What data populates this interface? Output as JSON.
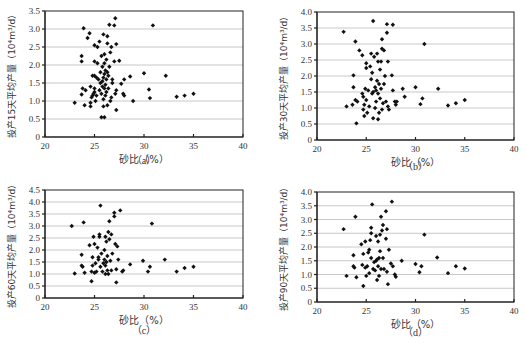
{
  "chart_data": [
    {
      "type": "scatter",
      "panel": "a",
      "caption": "（a）",
      "xlabel": "砂比（%）",
      "ylabel": "投产15天平均产量（10⁴m³/d）",
      "xlim": [
        20,
        40
      ],
      "ylim": [
        0,
        3.5
      ],
      "xticks": [
        "20",
        "25",
        "30",
        "35",
        "40"
      ],
      "yticks": [
        "0",
        "0.5",
        "1.0",
        "1.5",
        "2.0",
        "2.5",
        "3.0",
        "3.5"
      ],
      "ystep": 0.5,
      "grid": true,
      "points": [
        [
          23.0,
          0.95
        ],
        [
          23.7,
          1.18
        ],
        [
          23.8,
          1.35
        ],
        [
          23.7,
          2.1
        ],
        [
          23.7,
          2.25
        ],
        [
          23.9,
          3.02
        ],
        [
          24.0,
          0.88
        ],
        [
          24.1,
          1.3
        ],
        [
          24.3,
          2.75
        ],
        [
          24.5,
          2.88
        ],
        [
          24.6,
          0.85
        ],
        [
          24.6,
          0.95
        ],
        [
          24.6,
          1.4
        ],
        [
          24.7,
          1.1
        ],
        [
          24.8,
          1.15
        ],
        [
          24.8,
          1.7
        ],
        [
          24.9,
          1.2
        ],
        [
          25.0,
          1.25
        ],
        [
          25.0,
          1.35
        ],
        [
          25.0,
          1.7
        ],
        [
          25.0,
          2.1
        ],
        [
          25.0,
          2.55
        ],
        [
          25.1,
          1.0
        ],
        [
          25.2,
          1.15
        ],
        [
          25.2,
          1.65
        ],
        [
          25.3,
          2.05
        ],
        [
          25.3,
          2.5
        ],
        [
          25.4,
          1.6
        ],
        [
          25.5,
          1.3
        ],
        [
          25.5,
          2.65
        ],
        [
          25.6,
          1.5
        ],
        [
          25.6,
          1.8
        ],
        [
          25.7,
          0.55
        ],
        [
          25.7,
          1.2
        ],
        [
          25.7,
          2.25
        ],
        [
          25.8,
          1.4
        ],
        [
          25.8,
          1.55
        ],
        [
          25.8,
          1.95
        ],
        [
          25.9,
          0.85
        ],
        [
          25.9,
          1.05
        ],
        [
          25.9,
          1.65
        ],
        [
          25.9,
          2.85
        ],
        [
          26.0,
          0.55
        ],
        [
          26.0,
          1.35
        ],
        [
          26.0,
          1.75
        ],
        [
          26.0,
          2.05
        ],
        [
          26.0,
          2.3
        ],
        [
          26.1,
          1.15
        ],
        [
          26.1,
          1.45
        ],
        [
          26.1,
          1.85
        ],
        [
          26.2,
          1.25
        ],
        [
          26.2,
          1.6
        ],
        [
          26.2,
          2.15
        ],
        [
          26.3,
          0.88
        ],
        [
          26.3,
          1.8
        ],
        [
          26.3,
          2.6
        ],
        [
          26.3,
          2.8
        ],
        [
          26.4,
          1.35
        ],
        [
          26.4,
          1.7
        ],
        [
          26.5,
          1.95
        ],
        [
          26.5,
          3.12
        ],
        [
          26.6,
          1.0
        ],
        [
          26.6,
          2.35
        ],
        [
          26.7,
          1.1
        ],
        [
          26.7,
          2.5
        ],
        [
          26.8,
          1.5
        ],
        [
          26.8,
          1.6
        ],
        [
          27.0,
          3.1
        ],
        [
          27.0,
          2.1
        ],
        [
          27.1,
          3.3
        ],
        [
          27.1,
          1.2
        ],
        [
          27.2,
          0.75
        ],
        [
          27.2,
          1.3
        ],
        [
          27.2,
          2.58
        ],
        [
          27.5,
          2.12
        ],
        [
          27.7,
          1.48
        ],
        [
          27.9,
          1.2
        ],
        [
          28.0,
          1.15
        ],
        [
          28.0,
          1.6
        ],
        [
          28.6,
          1.68
        ],
        [
          28.9,
          1.0
        ],
        [
          30.0,
          1.77
        ],
        [
          30.5,
          1.32
        ],
        [
          30.6,
          1.08
        ],
        [
          30.9,
          3.1
        ],
        [
          32.2,
          1.7
        ],
        [
          33.3,
          1.12
        ],
        [
          34.1,
          1.15
        ],
        [
          35.0,
          1.2
        ]
      ]
    },
    {
      "type": "scatter",
      "panel": "b",
      "caption": "（b）",
      "xlabel": "砂比（%）",
      "ylabel": "投产30天平均产量（10⁴m³/d）",
      "xlim": [
        20,
        40
      ],
      "ylim": [
        0,
        4.0
      ],
      "xticks": [
        "20",
        "25",
        "30",
        "35",
        "40"
      ],
      "yticks": [
        "0",
        "0.5",
        "1.0",
        "1.5",
        "2.0",
        "2.5",
        "3.0",
        "3.5",
        "4.0"
      ],
      "ystep": 0.5,
      "grid": true,
      "points": [
        [
          22.7,
          3.38
        ],
        [
          23.0,
          1.05
        ],
        [
          23.6,
          1.1
        ],
        [
          23.7,
          1.65
        ],
        [
          23.7,
          2.02
        ],
        [
          23.9,
          1.25
        ],
        [
          23.9,
          3.08
        ],
        [
          24.0,
          0.52
        ],
        [
          24.1,
          1.2
        ],
        [
          24.3,
          2.8
        ],
        [
          24.6,
          2.65
        ],
        [
          24.6,
          1.45
        ],
        [
          24.7,
          0.95
        ],
        [
          24.7,
          1.35
        ],
        [
          24.8,
          0.75
        ],
        [
          24.8,
          1.1
        ],
        [
          24.9,
          1.6
        ],
        [
          25.0,
          2.25
        ],
        [
          25.0,
          2.4
        ],
        [
          25.0,
          1.25
        ],
        [
          25.1,
          0.85
        ],
        [
          25.2,
          1.55
        ],
        [
          25.3,
          1.05
        ],
        [
          25.4,
          2.3
        ],
        [
          25.5,
          1.9
        ],
        [
          25.5,
          2.7
        ],
        [
          25.6,
          1.45
        ],
        [
          25.6,
          2.1
        ],
        [
          25.7,
          0.68
        ],
        [
          25.7,
          1.5
        ],
        [
          25.7,
          3.72
        ],
        [
          25.8,
          2.6
        ],
        [
          25.9,
          1.0
        ],
        [
          25.9,
          1.65
        ],
        [
          26.0,
          1.2
        ],
        [
          26.0,
          1.55
        ],
        [
          26.1,
          1.85
        ],
        [
          26.1,
          2.7
        ],
        [
          26.2,
          0.65
        ],
        [
          26.2,
          1.45
        ],
        [
          26.2,
          2.45
        ],
        [
          26.3,
          0.85
        ],
        [
          26.3,
          1.75
        ],
        [
          26.4,
          1.3
        ],
        [
          26.4,
          2.2
        ],
        [
          26.5,
          1.6
        ],
        [
          26.5,
          2.45
        ],
        [
          26.6,
          0.95
        ],
        [
          26.6,
          2.85
        ],
        [
          26.6,
          3.15
        ],
        [
          26.7,
          1.15
        ],
        [
          26.8,
          1.75
        ],
        [
          26.8,
          2.8
        ],
        [
          26.9,
          2.0
        ],
        [
          27.0,
          1.2
        ],
        [
          27.1,
          3.35
        ],
        [
          27.1,
          3.62
        ],
        [
          27.2,
          1.05
        ],
        [
          27.2,
          2.45
        ],
        [
          27.3,
          0.95
        ],
        [
          27.6,
          2.02
        ],
        [
          27.7,
          1.55
        ],
        [
          27.7,
          3.6
        ],
        [
          27.9,
          1.2
        ],
        [
          28.0,
          1.1
        ],
        [
          28.1,
          1.2
        ],
        [
          28.7,
          1.6
        ],
        [
          28.9,
          1.35
        ],
        [
          30.0,
          1.65
        ],
        [
          30.5,
          1.12
        ],
        [
          30.7,
          1.3
        ],
        [
          30.9,
          3.0
        ],
        [
          32.3,
          1.6
        ],
        [
          33.3,
          1.08
        ],
        [
          34.1,
          1.15
        ],
        [
          35.0,
          1.25
        ]
      ]
    },
    {
      "type": "scatter",
      "panel": "c",
      "caption": "（c）",
      "xlabel": "砂比（%）",
      "ylabel": "投产60天平均产量（10⁴m³/d）",
      "xlim": [
        20,
        40
      ],
      "ylim": [
        0,
        4.5
      ],
      "xticks": [
        "20",
        "25",
        "30",
        "35",
        "40"
      ],
      "yticks": [
        "0",
        "0.5",
        "1.0",
        "1.5",
        "2.0",
        "2.5",
        "3.0",
        "3.5",
        "4.0",
        "4.5"
      ],
      "ystep": 0.5,
      "grid": true,
      "points": [
        [
          22.7,
          3.0
        ],
        [
          23.0,
          1.02
        ],
        [
          23.7,
          1.35
        ],
        [
          23.7,
          1.8
        ],
        [
          23.8,
          1.3
        ],
        [
          23.9,
          3.15
        ],
        [
          24.0,
          1.05
        ],
        [
          24.5,
          2.2
        ],
        [
          24.7,
          0.7
        ],
        [
          24.7,
          1.1
        ],
        [
          24.8,
          1.35
        ],
        [
          24.8,
          1.7
        ],
        [
          24.9,
          2.55
        ],
        [
          25.0,
          1.05
        ],
        [
          25.0,
          2.25
        ],
        [
          25.1,
          1.45
        ],
        [
          25.2,
          1.1
        ],
        [
          25.3,
          2.1
        ],
        [
          25.4,
          1.7
        ],
        [
          25.4,
          1.6
        ],
        [
          25.5,
          2.55
        ],
        [
          25.5,
          2.65
        ],
        [
          25.6,
          3.85
        ],
        [
          25.6,
          1.3
        ],
        [
          25.7,
          1.85
        ],
        [
          25.8,
          1.1
        ],
        [
          25.9,
          1.45
        ],
        [
          26.0,
          1.6
        ],
        [
          26.0,
          2.0
        ],
        [
          26.1,
          1.0
        ],
        [
          26.1,
          1.35
        ],
        [
          26.1,
          2.55
        ],
        [
          26.2,
          1.5
        ],
        [
          26.2,
          2.35
        ],
        [
          26.3,
          1.15
        ],
        [
          26.3,
          1.75
        ],
        [
          26.4,
          2.75
        ],
        [
          26.4,
          1.0
        ],
        [
          26.5,
          3.2
        ],
        [
          26.5,
          2.45
        ],
        [
          26.6,
          1.55
        ],
        [
          26.7,
          1.15
        ],
        [
          26.7,
          2.65
        ],
        [
          26.8,
          1.85
        ],
        [
          27.0,
          3.4
        ],
        [
          27.0,
          3.55
        ],
        [
          27.1,
          2.25
        ],
        [
          27.2,
          0.65
        ],
        [
          27.2,
          1.2
        ],
        [
          27.3,
          2.15
        ],
        [
          27.4,
          1.6
        ],
        [
          27.6,
          3.65
        ],
        [
          27.8,
          1.1
        ],
        [
          27.9,
          1.15
        ],
        [
          28.6,
          1.4
        ],
        [
          29.9,
          1.55
        ],
        [
          30.4,
          1.1
        ],
        [
          30.6,
          1.3
        ],
        [
          30.8,
          3.1
        ],
        [
          32.1,
          1.6
        ],
        [
          33.3,
          1.1
        ],
        [
          34.1,
          1.25
        ],
        [
          35.0,
          1.3
        ]
      ]
    },
    {
      "type": "scatter",
      "panel": "d",
      "caption": "（d）",
      "xlabel": "砂比（%）",
      "ylabel": "投产90天平均产量（10⁴m³/d）",
      "xlim": [
        20,
        40
      ],
      "ylim": [
        0,
        4.0
      ],
      "xticks": [
        "20",
        "25",
        "30",
        "35",
        "40"
      ],
      "yticks": [
        "0",
        "0.5",
        "1.0",
        "1.5",
        "2.0",
        "2.5",
        "3.0",
        "3.5",
        "4.0"
      ],
      "ystep": 0.5,
      "grid": true,
      "points": [
        [
          22.7,
          2.65
        ],
        [
          23.0,
          0.95
        ],
        [
          23.7,
          1.3
        ],
        [
          23.7,
          1.7
        ],
        [
          23.8,
          1.25
        ],
        [
          23.9,
          3.1
        ],
        [
          24.0,
          0.9
        ],
        [
          24.5,
          2.1
        ],
        [
          24.6,
          1.35
        ],
        [
          24.7,
          0.58
        ],
        [
          24.7,
          1.75
        ],
        [
          24.9,
          2.2
        ],
        [
          24.9,
          1.25
        ],
        [
          25.0,
          0.95
        ],
        [
          25.1,
          1.3
        ],
        [
          25.2,
          1.8
        ],
        [
          25.3,
          1.05
        ],
        [
          25.3,
          1.9
        ],
        [
          25.4,
          2.25
        ],
        [
          25.5,
          1.6
        ],
        [
          25.5,
          2.5
        ],
        [
          25.5,
          2.7
        ],
        [
          25.6,
          3.55
        ],
        [
          25.7,
          1.2
        ],
        [
          25.8,
          1.45
        ],
        [
          25.9,
          1.15
        ],
        [
          26.0,
          1.5
        ],
        [
          26.0,
          2.4
        ],
        [
          26.1,
          0.8
        ],
        [
          26.1,
          1.55
        ],
        [
          26.2,
          1.3
        ],
        [
          26.2,
          2.2
        ],
        [
          26.3,
          1.6
        ],
        [
          26.3,
          0.95
        ],
        [
          26.4,
          1.85
        ],
        [
          26.4,
          2.45
        ],
        [
          26.5,
          3.1
        ],
        [
          26.5,
          1.2
        ],
        [
          26.6,
          2.6
        ],
        [
          26.7,
          1.6
        ],
        [
          26.7,
          2.8
        ],
        [
          26.8,
          1.2
        ],
        [
          27.0,
          3.3
        ],
        [
          27.0,
          2.3
        ],
        [
          27.1,
          2.65
        ],
        [
          27.1,
          1.1
        ],
        [
          27.2,
          0.65
        ],
        [
          27.3,
          1.9
        ],
        [
          27.5,
          1.4
        ],
        [
          27.6,
          3.65
        ],
        [
          27.7,
          1.3
        ],
        [
          27.9,
          1.0
        ],
        [
          28.0,
          0.92
        ],
        [
          28.6,
          1.5
        ],
        [
          30.0,
          1.38
        ],
        [
          30.4,
          1.08
        ],
        [
          30.6,
          1.3
        ],
        [
          30.9,
          2.45
        ],
        [
          32.2,
          1.62
        ],
        [
          33.3,
          1.05
        ],
        [
          34.1,
          1.3
        ],
        [
          35.0,
          1.22
        ]
      ]
    }
  ]
}
